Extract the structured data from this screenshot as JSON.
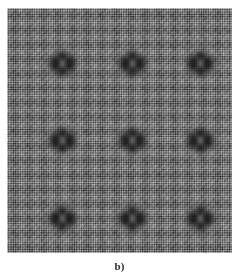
{
  "figure": {
    "caption_label": "b)",
    "alt_title": "Grayscale interference intensity map with 3x3 array of localized bright spots",
    "background_color": "#ffffff",
    "panel": {
      "x": 7,
      "y": 8,
      "width": 225,
      "height": 245,
      "base_gray": "#6f6f6f",
      "border_color": "#ffffff"
    }
  },
  "chart_data": {
    "type": "heatmap",
    "title": "b)",
    "subtitle": "",
    "xlabel": "",
    "ylabel": "",
    "colormap": "grayscale",
    "value_min": 0,
    "value_max": 1,
    "grid": false,
    "legend": "none",
    "axis_ticks_visible": false,
    "xlim": [
      0,
      225
    ],
    "ylim": [
      0,
      245
    ],
    "background_texture": {
      "description": "fine orthogonal mesh / moire fringe carpet",
      "period_x_px": 2.35,
      "period_y_px": 2.35,
      "coarse_period_x_px": 14.5,
      "coarse_period_y_px": 14.5,
      "mean_gray_level": 0.44,
      "fringe_amplitude": 0.17
    },
    "features": {
      "description": "3x3 lattice of localized peaks; each peak is a bright core surrounded by four dark diagonal lobes",
      "count": 9,
      "core_peak_value": 0.95,
      "lobe_value": 0.06,
      "core_radius_px": 4.5,
      "lobe_offset_px": 7.5,
      "envelope_radius_px": 17,
      "columns_x": [
        62,
        132,
        200
      ],
      "rows_y": [
        63,
        140,
        218
      ],
      "points": [
        {
          "id": "f-0-0",
          "x": 62,
          "y": 63,
          "intensity": 0.93
        },
        {
          "id": "f-0-1",
          "x": 132,
          "y": 63,
          "intensity": 0.95
        },
        {
          "id": "f-0-2",
          "x": 200,
          "y": 63,
          "intensity": 0.92
        },
        {
          "id": "f-1-0",
          "x": 62,
          "y": 140,
          "intensity": 0.94
        },
        {
          "id": "f-1-1",
          "x": 132,
          "y": 140,
          "intensity": 0.96
        },
        {
          "id": "f-1-2",
          "x": 200,
          "y": 140,
          "intensity": 0.93
        },
        {
          "id": "f-2-0",
          "x": 62,
          "y": 218,
          "intensity": 0.94
        },
        {
          "id": "f-2-1",
          "x": 132,
          "y": 218,
          "intensity": 0.95
        },
        {
          "id": "f-2-2",
          "x": 200,
          "y": 218,
          "intensity": 0.93
        }
      ]
    }
  }
}
